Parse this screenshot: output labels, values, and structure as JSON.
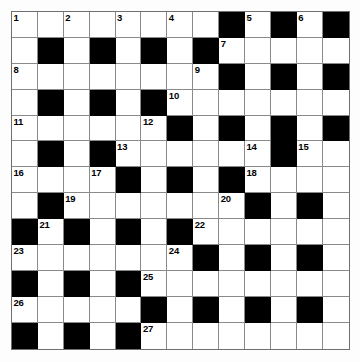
{
  "puzzle": {
    "title": "Crossword Grid",
    "rows": 13,
    "cols": 13,
    "colors": {
      "block": "#000000",
      "cell": "#ffffff",
      "gridline": "#8a8a8a",
      "border": "#6f6f6f",
      "number": "#000000"
    },
    "grid": [
      [
        "W:1",
        "W",
        "W:2",
        "W",
        "W:3",
        "W",
        "W:4",
        "W",
        "B",
        "W:5",
        "B",
        "W:6",
        "B"
      ],
      [
        "W",
        "B",
        "W",
        "B",
        "W",
        "B",
        "W",
        "B",
        "W:7",
        "W",
        "W",
        "W",
        "W"
      ],
      [
        "W:8",
        "W",
        "W",
        "W",
        "W",
        "W",
        "W",
        "W:9",
        "B",
        "W",
        "B",
        "W",
        "B"
      ],
      [
        "W",
        "B",
        "W",
        "B",
        "W",
        "B",
        "W:10",
        "W",
        "W",
        "W",
        "W",
        "W",
        "W"
      ],
      [
        "W:11",
        "W",
        "W",
        "W",
        "W",
        "W:12",
        "B",
        "W",
        "B",
        "W",
        "B",
        "W",
        "B"
      ],
      [
        "W",
        "B",
        "W",
        "B",
        "W:13",
        "W",
        "W",
        "W",
        "W",
        "W:14",
        "B",
        "W:15",
        "W"
      ],
      [
        "W:16",
        "W",
        "W",
        "W:17",
        "B",
        "W",
        "B",
        "W",
        "B",
        "W:18",
        "W",
        "W",
        "W"
      ],
      [
        "W",
        "B",
        "W:19",
        "W",
        "W",
        "W",
        "W",
        "W",
        "W:20",
        "B",
        "W",
        "B",
        "W"
      ],
      [
        "B",
        "W:21",
        "B",
        "W",
        "B",
        "W",
        "B",
        "W:22",
        "W",
        "W",
        "W",
        "W",
        "W"
      ],
      [
        "W:23",
        "W",
        "W",
        "W",
        "W",
        "W",
        "W:24",
        "B",
        "W",
        "B",
        "W",
        "B",
        "W"
      ],
      [
        "B",
        "W",
        "B",
        "W",
        "B",
        "W:25",
        "W",
        "W",
        "W",
        "W",
        "W",
        "W",
        "W"
      ],
      [
        "W:26",
        "W",
        "W",
        "W",
        "W",
        "B",
        "W",
        "B",
        "W",
        "B",
        "W",
        "B",
        "W"
      ],
      [
        "B",
        "W",
        "B",
        "W",
        "B",
        "W:27",
        "W",
        "W",
        "W",
        "W",
        "W",
        "W",
        "W"
      ]
    ],
    "clue_numbers": [
      1,
      2,
      3,
      4,
      5,
      6,
      7,
      8,
      9,
      10,
      11,
      12,
      13,
      14,
      15,
      16,
      17,
      18,
      19,
      20,
      21,
      22,
      23,
      24,
      25,
      26,
      27
    ]
  }
}
